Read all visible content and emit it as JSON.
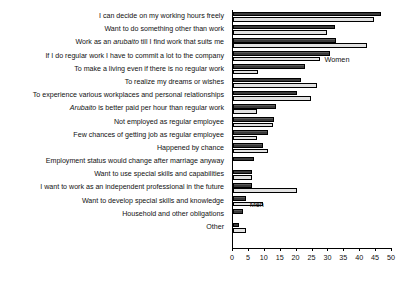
{
  "chart_data": {
    "type": "bar",
    "orientation": "horizontal",
    "title": "",
    "xlabel": "",
    "ylabel": "",
    "xlim": [
      0,
      50
    ],
    "xticks": [
      0,
      5,
      10,
      15,
      20,
      25,
      30,
      35,
      40,
      45,
      50
    ],
    "grid": false,
    "legend_position": "inline-annotation",
    "annotations": [
      {
        "text": "Women",
        "series": "Women",
        "category_index": 3
      },
      {
        "text": "Men",
        "series": "Men",
        "category_index": 14
      }
    ],
    "categories": [
      "I can decide on my working hours freely",
      "Want to do something other than work",
      "Work as an arubaito till I find work that suits me",
      "If I do regular work I have to commit a lot to the company",
      "To make a living even if there is no regular work",
      "To realize my dreams or wishes",
      "To experience various workplaces and personal relationships",
      "Arubaito is better paid per hour than regular work",
      "Not employed as regular employee",
      "Few chances of getting job as regular employee",
      "Happened by chance",
      "Employment status would change after marriage anyway",
      "Want to use special skills and capabilities",
      "I want to work as an independent professional in the future",
      "Want to develop special skills and knowledge",
      "Household and other obligations",
      "Other"
    ],
    "series": [
      {
        "name": "Men",
        "color": "#4d4d4d",
        "values": [
          46.5,
          32.0,
          32.5,
          30.5,
          22.5,
          21.5,
          20.0,
          13.5,
          13.0,
          11.0,
          9.5,
          6.5,
          6.0,
          6.0,
          4.0,
          3.0,
          2.0
        ]
      },
      {
        "name": "Women",
        "color": "#e2e2e2",
        "values": [
          44.3,
          29.5,
          42.0,
          27.5,
          8.0,
          26.5,
          24.5,
          7.5,
          12.5,
          7.5,
          11.0,
          0.0,
          6.0,
          20.0,
          9.5,
          0.0,
          4.0
        ]
      }
    ]
  }
}
